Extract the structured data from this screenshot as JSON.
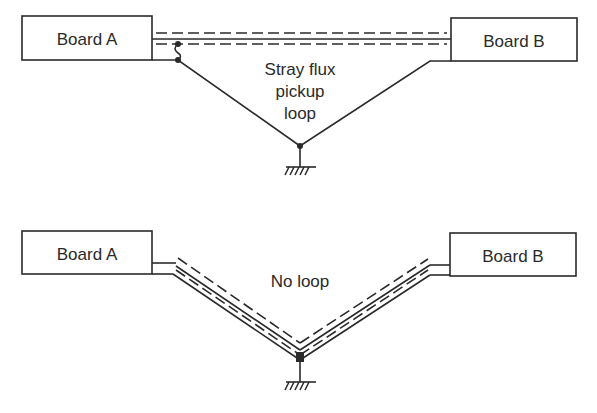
{
  "panels": {
    "top": {
      "board_a_label": "Board A",
      "board_b_label": "Board B",
      "annotation_line1": "Stray flux",
      "annotation_line2": "pickup",
      "annotation_line3": "loop"
    },
    "bottom": {
      "board_a_label": "Board A",
      "board_b_label": "Board B",
      "annotation": "No loop"
    }
  },
  "colors": {
    "stroke": "#2a2a2a",
    "background": "#ffffff"
  }
}
